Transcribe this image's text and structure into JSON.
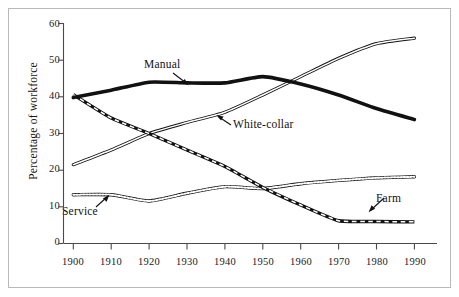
{
  "chart_data": {
    "type": "line",
    "title": "",
    "subtitle": "",
    "xlabel": "",
    "ylabel": "Percentage of workforce",
    "xlim": [
      1900,
      1990
    ],
    "ylim": [
      0,
      60
    ],
    "grid": false,
    "legend_position": "inline-annotations",
    "x_ticks": [
      "1900",
      "1910",
      "1920",
      "1930",
      "1940",
      "1950",
      "1960",
      "1970",
      "1980",
      "1990"
    ],
    "y_ticks": [
      "0",
      "10",
      "20",
      "30",
      "40",
      "50",
      "60"
    ],
    "x": [
      1900,
      1910,
      1920,
      1930,
      1940,
      1950,
      1960,
      1970,
      1980,
      1990
    ],
    "series": [
      {
        "name": "Manual",
        "style": "thick-solid",
        "color": "#111111",
        "values": [
          39.8,
          41.8,
          44.0,
          43.8,
          43.8,
          45.5,
          43.5,
          40.5,
          36.8,
          33.8
        ]
      },
      {
        "name": "White-collar",
        "style": "double-hairline",
        "color": "#111111",
        "values": [
          21.5,
          25.5,
          30.0,
          33.0,
          35.8,
          40.5,
          45.5,
          50.5,
          54.5,
          56.0
        ]
      },
      {
        "name": "Service",
        "style": "beaded-dotted",
        "color": "#111111",
        "values": [
          13.3,
          13.3,
          11.6,
          13.7,
          15.5,
          15.0,
          16.3,
          17.2,
          17.9,
          18.2
        ]
      },
      {
        "name": "Farm",
        "style": "dashed-band",
        "color": "#111111",
        "values": [
          40.6,
          34.2,
          30.0,
          25.5,
          21.0,
          15.3,
          10.5,
          6.2,
          6.0,
          5.9
        ]
      }
    ],
    "annotations": [
      {
        "text": "Manual",
        "points_to_series": "Manual",
        "points_to_x": 1930
      },
      {
        "text": "White-collar",
        "points_to_series": "White-collar",
        "points_to_x": 1936
      },
      {
        "text": "Service",
        "points_to_series": "Service",
        "points_to_x": 1913
      },
      {
        "text": "Farm",
        "points_to_series": "Farm",
        "points_to_x": 1977
      }
    ]
  }
}
